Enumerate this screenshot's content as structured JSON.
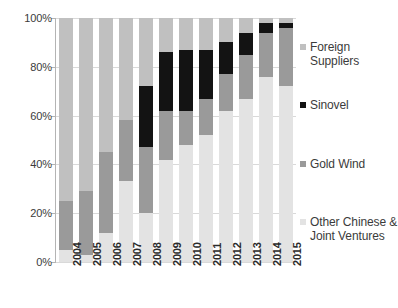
{
  "chart_data": {
    "type": "bar",
    "subtype": "stacked-100-percent",
    "title": "",
    "subtitle": "",
    "xlabel": "",
    "ylabel": "",
    "categories": [
      "2004",
      "2005",
      "2006",
      "2007",
      "2008",
      "2009",
      "2010",
      "2011",
      "2012",
      "2013",
      "2014",
      "2015"
    ],
    "ylim": [
      0,
      100
    ],
    "yticks": [
      0,
      20,
      40,
      60,
      80,
      100
    ],
    "ytick_labels": [
      "0%",
      "20%",
      "40%",
      "60%",
      "80%",
      "100%"
    ],
    "grid": true,
    "grid_axis": "y",
    "legend_position": "right",
    "stack_order_bottom_to_top": [
      "Other Chinese & Joint Ventures",
      "Gold Wind",
      "Sinovel",
      "Foreign Suppliers"
    ],
    "series": [
      {
        "name": "Other Chinese & Joint Ventures",
        "color": "#e3e3e3",
        "values": [
          5,
          3,
          12,
          33,
          20,
          42,
          48,
          52,
          62,
          67,
          76,
          72
        ]
      },
      {
        "name": "Gold Wind",
        "color": "#9a9a9a",
        "values": [
          20,
          26,
          33,
          25,
          27,
          20,
          14,
          15,
          15,
          18,
          18,
          24
        ]
      },
      {
        "name": "Sinovel",
        "color": "#131313",
        "values": [
          0,
          0,
          0,
          0,
          25,
          24,
          25,
          20,
          13,
          9,
          4,
          2
        ]
      },
      {
        "name": "Foreign Suppliers",
        "color": "#c0c0c0",
        "values": [
          75,
          71,
          55,
          42,
          28,
          14,
          13,
          13,
          10,
          6,
          2,
          2
        ]
      }
    ]
  },
  "legend": {
    "items": [
      {
        "label": "Foreign Suppliers",
        "color": "#c0c0c0"
      },
      {
        "label": "Sinovel",
        "color": "#131313"
      },
      {
        "label": "Gold Wind",
        "color": "#9a9a9a"
      },
      {
        "label": "Other Chinese & Joint Ventures",
        "color": "#e3e3e3"
      }
    ]
  },
  "axis": {
    "y_tick_labels": [
      "100%",
      "80%",
      "60%",
      "40%",
      "20%",
      "0%"
    ],
    "x_tick_labels": [
      "2004",
      "2005",
      "2006",
      "2007",
      "2008",
      "2009",
      "2010",
      "2011",
      "2012",
      "2013",
      "2014",
      "2015"
    ]
  },
  "colors": {
    "background": "#ffffff",
    "grid": "#d9d9d9",
    "axis": "#b4b4b4",
    "text": "#3b3b3b"
  }
}
